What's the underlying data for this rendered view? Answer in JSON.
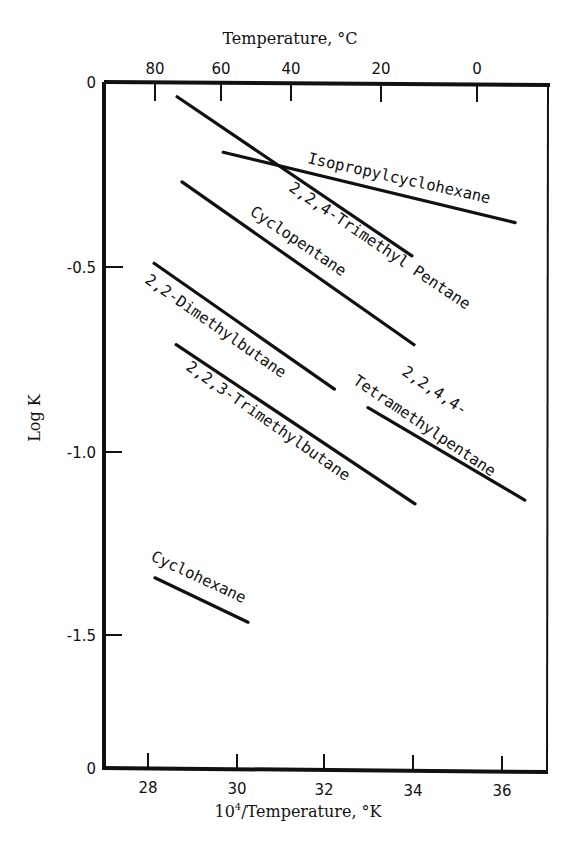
{
  "chart_data": {
    "type": "line",
    "title": "",
    "xlabel": "10^4/Temperature, °K",
    "xlabel_base": "10",
    "xlabel_sup": "4",
    "xlabel_rest": "/Temperature, °K",
    "ylabel": "Log K",
    "top_xlabel": "Temperature, °C",
    "xlim": [
      27,
      37
    ],
    "ylim": [
      -1.87,
      0
    ],
    "grid": false,
    "legend": "none (inline labels)",
    "x_ticks": [
      28,
      30,
      32,
      34,
      36
    ],
    "x_tick_labels": [
      "28",
      "30",
      "32",
      "34",
      "36"
    ],
    "top_ticks_celsius": [
      80,
      60,
      40,
      20,
      0
    ],
    "top_tick_labels": [
      "80",
      "60",
      "40",
      "20",
      "0"
    ],
    "y_ticks": [
      0,
      -0.5,
      -1.0,
      -1.5
    ],
    "y_tick_labels": [
      "0",
      "-0.5",
      "-1.0",
      "-1.5"
    ],
    "y_bottom_label": "0",
    "series": [
      {
        "name": "2,2,4-Trimethyl Pentane",
        "x": [
          28.65,
          33.95
        ],
        "y": [
          -0.04,
          -0.47
        ]
      },
      {
        "name": "Isopropylcyclohexane",
        "x": [
          29.69,
          36.28
        ],
        "y": [
          -0.19,
          -0.38
        ]
      },
      {
        "name": "Cyclopentane",
        "x": [
          28.76,
          34.0
        ],
        "y": [
          -0.27,
          -0.71
        ]
      },
      {
        "name": "2,2-Dimethylbutane",
        "x": [
          28.13,
          32.2
        ],
        "y": [
          -0.49,
          -0.83
        ]
      },
      {
        "name": "2,2,3-Trimethylbutane",
        "x": [
          28.63,
          34.02
        ],
        "y": [
          -0.71,
          -1.14
        ]
      },
      {
        "name": "2,2,4,4-Tetramethylpentane",
        "label_line1": "2,2,4,4-",
        "label_line2": "Tetramethylpentane",
        "x": [
          32.96,
          36.5
        ],
        "y": [
          -0.88,
          -1.13
        ]
      },
      {
        "name": "Cyclohexane",
        "x": [
          28.15,
          30.25
        ],
        "y": [
          -1.34,
          -1.46
        ]
      }
    ]
  }
}
